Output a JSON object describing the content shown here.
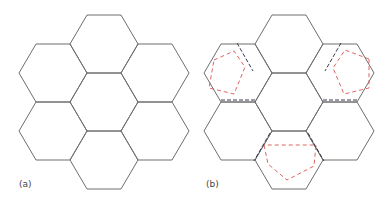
{
  "panels": [
    {
      "id": "a",
      "label": "(a)",
      "center": [
        104,
        102
      ],
      "description": "Seven flat-topped hexagons: one central hexagon surrounded by six neighbours"
    },
    {
      "id": "b",
      "label": "(b)",
      "center": [
        289,
        102
      ],
      "description": "Same seven-hexagon cluster with three dashed red pentagons overlaid in alternate outer hexagons and black dashed lines along shared edges"
    }
  ],
  "colors": {
    "hex_stroke": "#6e6e6e",
    "pentagon_stroke": "#d9534f",
    "dashed_edge_stroke": "#3a3a55",
    "label": "#444444"
  },
  "geometry": {
    "hex_half_edge": 17,
    "hex_radius": 34,
    "hex_half_height": 29,
    "neighbor_dx": 51,
    "neighbor_dy": 29,
    "vertical_dy": 58
  }
}
